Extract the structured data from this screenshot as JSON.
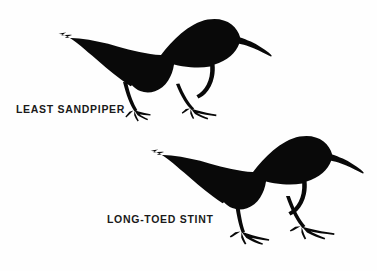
{
  "figure": {
    "background_color": "#fefefe",
    "ink_color": "#090909",
    "width": 377,
    "height": 271,
    "style": "field-guide silhouette comparison plate"
  },
  "labels": {
    "top_bird": "LEAST SANDPIPER",
    "bottom_bird": "LONG-TOED STINT"
  },
  "birds": [
    {
      "name": "least-sandpiper",
      "label": "LEAST SANDPIPER",
      "position": "upper-left",
      "facing": "right",
      "toes": "short",
      "posture": "crouched, horizontal body"
    },
    {
      "name": "long-toed-stint",
      "label": "LONG-TOED STINT",
      "position": "lower-right",
      "facing": "right",
      "toes": "long",
      "posture": "upright, longer legs and toes"
    }
  ]
}
